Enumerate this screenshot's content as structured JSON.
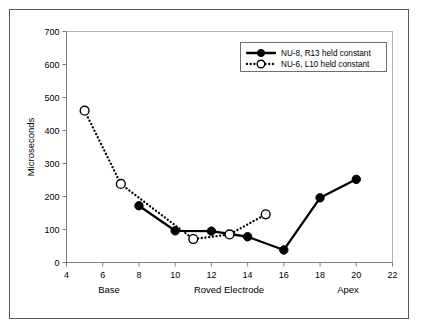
{
  "chart_data": {
    "type": "line",
    "title": "",
    "xlabel": "Roved Electrode",
    "ylabel": "Microseconds",
    "xlim": [
      4,
      22
    ],
    "ylim": [
      0,
      700
    ],
    "xticks": [
      4,
      6,
      8,
      10,
      12,
      14,
      16,
      18,
      20,
      22
    ],
    "yticks": [
      0,
      100,
      200,
      300,
      400,
      500,
      600,
      700
    ],
    "grid": false,
    "legend_position": "top-right",
    "x_axis_end_labels": {
      "left": "Base",
      "center": "Roved Electrode",
      "right": "Apex"
    },
    "series": [
      {
        "name": "NU-8, R13 held constant",
        "style": "solid",
        "marker": "filled-circle",
        "x": [
          8,
          10,
          12,
          14,
          16,
          18,
          20
        ],
        "values": [
          172,
          96,
          95,
          78,
          38,
          196,
          252
        ]
      },
      {
        "name": "NU-6, L10 held constant",
        "style": "dotted",
        "marker": "open-circle",
        "x": [
          5,
          7,
          11,
          13,
          15
        ],
        "values": [
          460,
          238,
          71,
          85,
          146
        ]
      }
    ]
  },
  "axis": {
    "ylabel": "Microseconds",
    "ytick_labels": [
      "700",
      "600",
      "500",
      "400",
      "300",
      "200",
      "100",
      "0"
    ],
    "xtick_labels": [
      "4",
      "6",
      "8",
      "10",
      "12",
      "14",
      "16",
      "18",
      "20",
      "22"
    ],
    "base_label": "Base",
    "center_label": "Roved Electrode",
    "apex_label": "Apex"
  },
  "legend": {
    "entries": [
      {
        "label": "NU-8, R13 held constant",
        "style": "solid",
        "marker": "filled-circle"
      },
      {
        "label": "NU-6, L10 held constant",
        "style": "dotted",
        "marker": "open-circle"
      }
    ]
  },
  "colors": {
    "ink": "#000000",
    "axis": "#808080",
    "plot_border": "#b4b4b4",
    "frame": "#58585a",
    "background": "#ffffff"
  }
}
